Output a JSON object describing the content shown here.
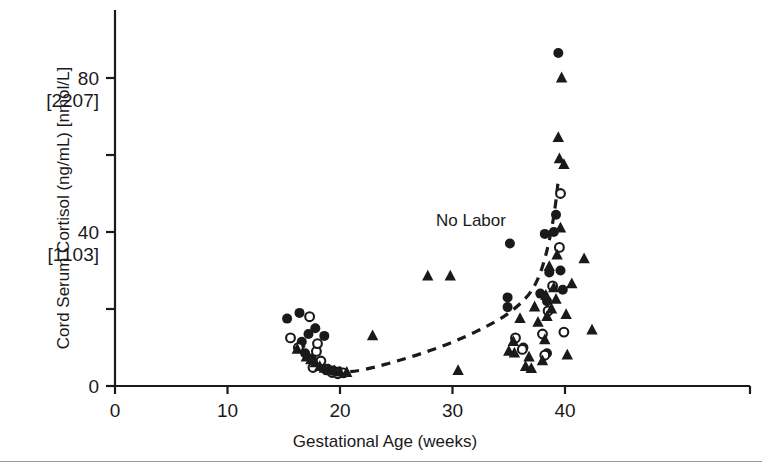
{
  "figure": {
    "annotation": "No Labor",
    "colors": {
      "ink": "#1a1a1a",
      "rule": "#9a9a9a",
      "background": "#ffffff"
    }
  },
  "chart_data": {
    "type": "scatter",
    "title": "",
    "annotation": "No Labor",
    "xlabel": "Gestational Age (weeks)",
    "ylabel": "Cord Serum Cortisol (ng/mL) [nmol/L]",
    "xlim": [
      0,
      45
    ],
    "ylim": [
      0,
      93
    ],
    "grid": false,
    "legend": "none",
    "xticks": [
      0,
      10,
      20,
      30,
      40
    ],
    "xticklabels": [
      "0",
      "10",
      "20",
      "30",
      "40"
    ],
    "yticks": [
      0,
      20,
      40,
      60,
      80
    ],
    "yticklabels": [
      "0",
      "",
      "40",
      "",
      "80"
    ],
    "ytick_secondary_labels": {
      "40": "[1103]",
      "80": "[2207]"
    },
    "ytick_minor": [
      20,
      60
    ],
    "series": [
      {
        "name": "filled-circle",
        "marker": "filled circle",
        "points": [
          [
            15.3,
            17.5
          ],
          [
            16.4,
            19.0
          ],
          [
            16.6,
            11.5
          ],
          [
            17.2,
            13.5
          ],
          [
            17.8,
            15.0
          ],
          [
            18.6,
            13.0
          ],
          [
            16.9,
            8.5
          ],
          [
            17.5,
            7.0
          ],
          [
            18.1,
            5.5
          ],
          [
            18.9,
            4.5
          ],
          [
            19.4,
            4.0
          ],
          [
            19.9,
            3.8
          ],
          [
            34.9,
            23.0
          ],
          [
            34.9,
            20.5
          ],
          [
            35.1,
            37.0
          ],
          [
            37.8,
            24.0
          ],
          [
            38.2,
            39.5
          ],
          [
            38.4,
            22.0
          ],
          [
            38.6,
            29.5
          ],
          [
            39.0,
            40.0
          ],
          [
            39.2,
            44.5
          ],
          [
            39.4,
            86.5
          ],
          [
            39.6,
            30.0
          ],
          [
            39.8,
            25.0
          ],
          [
            36.3,
            10.0
          ],
          [
            38.4,
            8.5
          ]
        ]
      },
      {
        "name": "open-circle",
        "marker": "open circle",
        "points": [
          [
            15.6,
            12.5
          ],
          [
            16.3,
            10.0
          ],
          [
            17.3,
            18.0
          ],
          [
            17.9,
            9.0
          ],
          [
            18.3,
            6.5
          ],
          [
            18.8,
            4.2
          ],
          [
            19.3,
            3.5
          ],
          [
            19.8,
            3.2
          ],
          [
            20.3,
            3.4
          ],
          [
            18.0,
            11.0
          ],
          [
            17.6,
            4.8
          ],
          [
            35.6,
            12.5
          ],
          [
            36.2,
            9.5
          ],
          [
            38.2,
            8.0
          ],
          [
            38.5,
            19.5
          ],
          [
            38.9,
            26.0
          ],
          [
            39.5,
            36.0
          ],
          [
            39.6,
            50.0
          ],
          [
            39.9,
            14.0
          ],
          [
            38.0,
            13.5
          ]
        ]
      },
      {
        "name": "filled-triangle",
        "marker": "filled triangle",
        "points": [
          [
            16.2,
            9.5
          ],
          [
            17.0,
            7.5
          ],
          [
            17.4,
            6.8
          ],
          [
            17.8,
            6.0
          ],
          [
            18.2,
            5.0
          ],
          [
            18.6,
            4.6
          ],
          [
            19.0,
            4.2
          ],
          [
            19.5,
            3.9
          ],
          [
            20.0,
            3.6
          ],
          [
            20.6,
            3.5
          ],
          [
            22.9,
            13.0
          ],
          [
            27.8,
            28.5
          ],
          [
            29.8,
            28.5
          ],
          [
            30.5,
            4.0
          ],
          [
            35.0,
            9.0
          ],
          [
            35.4,
            11.5
          ],
          [
            35.5,
            8.5
          ],
          [
            36.0,
            17.5
          ],
          [
            36.5,
            5.0
          ],
          [
            37.3,
            20.5
          ],
          [
            37.6,
            16.5
          ],
          [
            38.0,
            6.5
          ],
          [
            38.2,
            12.0
          ],
          [
            38.3,
            23.5
          ],
          [
            38.4,
            18.0
          ],
          [
            38.6,
            31.0
          ],
          [
            38.8,
            20.0
          ],
          [
            39.0,
            25.5
          ],
          [
            39.2,
            22.5
          ],
          [
            39.3,
            34.0
          ],
          [
            39.4,
            64.5
          ],
          [
            39.5,
            59.0
          ],
          [
            39.6,
            41.0
          ],
          [
            39.7,
            80.0
          ],
          [
            39.9,
            57.5
          ],
          [
            40.1,
            18.5
          ],
          [
            40.2,
            8.0
          ],
          [
            40.6,
            26.5
          ],
          [
            41.7,
            33.0
          ],
          [
            42.4,
            14.5
          ],
          [
            36.8,
            7.5
          ],
          [
            37.0,
            4.5
          ]
        ]
      }
    ],
    "trend_curve": {
      "style": "dashed",
      "points": [
        [
          16.4,
          12.0
        ],
        [
          17.0,
          9.0
        ],
        [
          17.6,
          7.0
        ],
        [
          18.3,
          5.3
        ],
        [
          19.2,
          4.2
        ],
        [
          20.2,
          3.6
        ],
        [
          21.5,
          3.9
        ],
        [
          23.0,
          4.8
        ],
        [
          25.0,
          6.4
        ],
        [
          27.0,
          8.2
        ],
        [
          29.0,
          10.2
        ],
        [
          31.0,
          12.6
        ],
        [
          33.0,
          15.4
        ],
        [
          34.6,
          18.0
        ],
        [
          36.0,
          21.2
        ],
        [
          37.0,
          24.4
        ],
        [
          37.8,
          29.0
        ],
        [
          38.4,
          35.0
        ],
        [
          38.9,
          42.0
        ],
        [
          39.2,
          48.0
        ],
        [
          39.4,
          53.5
        ]
      ]
    }
  }
}
